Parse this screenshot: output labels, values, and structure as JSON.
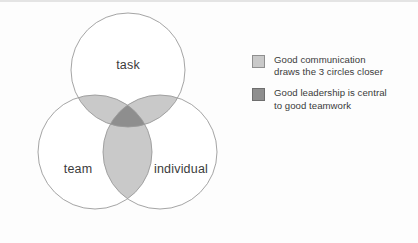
{
  "figure": {
    "background_color": "#fdfdfd"
  },
  "diagram": {
    "type": "venn-3",
    "circles": [
      {
        "id": "task",
        "label": "task",
        "position": "top",
        "cx": 128,
        "cy": 70,
        "r": 57,
        "fill": "#ffffff",
        "stroke": "#9a9a9a"
      },
      {
        "id": "team",
        "label": "team",
        "position": "bottom-left",
        "cx": 95,
        "cy": 152,
        "r": 57,
        "fill": "#ffffff",
        "stroke": "#9a9a9a"
      },
      {
        "id": "individual",
        "label": "individual",
        "position": "bottom-right",
        "cx": 160,
        "cy": 152,
        "r": 57,
        "fill": "#ffffff",
        "stroke": "#9a9a9a"
      }
    ],
    "overlap_pair_color": "#c9c9c9",
    "overlap_triple_color": "#8e8e8e",
    "label_color": "#3b3b3b"
  },
  "legend": {
    "items": [
      {
        "swatch": "light",
        "swatch_color": "#c9c9c9",
        "line1": "Good communication",
        "line2": "draws the 3 circles closer"
      },
      {
        "swatch": "dark",
        "swatch_color": "#8e8e8e",
        "line1": "Good leadership is central",
        "line2": "to good teamwork"
      }
    ]
  }
}
